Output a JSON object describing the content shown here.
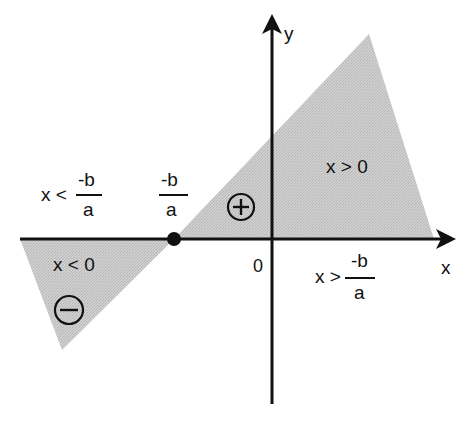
{
  "diagram": {
    "colors": {
      "shade": "#c9c9c9",
      "line": "#111111",
      "background": "#ffffff"
    },
    "axes": {
      "x_label": "x",
      "y_label": "y",
      "origin_label": "0"
    },
    "root": {
      "label_numerator": "-b",
      "label_denominator": "a",
      "marker": "filled-dot"
    },
    "regions": {
      "left": {
        "inequality_prefix": "x <",
        "fraction_numerator": "-b",
        "fraction_denominator": "a",
        "condition": "x < 0",
        "sign_symbol": "−",
        "sign_icon": "minus-circle-icon"
      },
      "right": {
        "inequality_prefix": "x >",
        "fraction_numerator": "-b",
        "fraction_denominator": "a",
        "condition": "x > 0",
        "sign_symbol": "+",
        "sign_icon": "plus-circle-icon"
      }
    }
  }
}
